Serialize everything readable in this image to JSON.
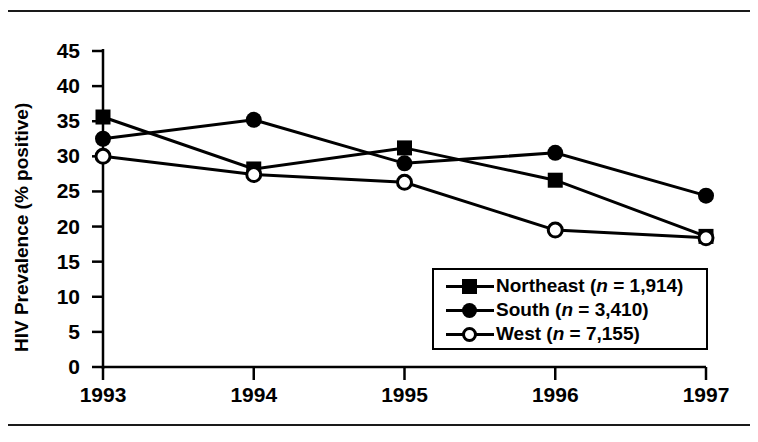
{
  "figure": {
    "rule_top": "horizontal-rule",
    "rule_bottom": "horizontal-rule"
  },
  "chart_data": {
    "type": "line",
    "title": "",
    "xlabel": "",
    "ylabel": "HIV Prevalence (% positive)",
    "x": [
      "1993",
      "1994",
      "1995",
      "1996",
      "1997"
    ],
    "categories": [
      "1993",
      "1994",
      "1995",
      "1996",
      "1997"
    ],
    "xticklabels": [
      "1993",
      "1994",
      "1995",
      "1996",
      "1997"
    ],
    "yticklabels": [
      "0",
      "5",
      "10",
      "15",
      "20",
      "25",
      "30",
      "35",
      "40",
      "45"
    ],
    "yticks": [
      0,
      5,
      10,
      15,
      20,
      25,
      30,
      35,
      40,
      45
    ],
    "ylim": [
      0,
      45
    ],
    "grid": false,
    "legend_position": "lower-right",
    "series": [
      {
        "name": "Northeast",
        "legend_label": "Northeast (n = 1,914)",
        "n": "1,914",
        "marker": "filled-square",
        "color": "#000000",
        "values": [
          35.6,
          28.2,
          31.2,
          26.6,
          18.6
        ]
      },
      {
        "name": "South",
        "legend_label": "South (n = 3,410)",
        "n": "3,410",
        "marker": "filled-circle",
        "color": "#000000",
        "values": [
          32.5,
          35.2,
          29.0,
          30.5,
          24.4
        ]
      },
      {
        "name": "West",
        "legend_label": "West (n = 7,155)",
        "n": "7,155",
        "marker": "open-circle",
        "color": "#000000",
        "values": [
          30.0,
          27.4,
          26.3,
          19.5,
          18.4
        ]
      }
    ]
  },
  "legend": {
    "rows": [
      {
        "label_plain": "Northeast (n = 1,914)",
        "name": "Northeast",
        "n": "1,914"
      },
      {
        "label_plain": "South (n = 3,410)",
        "name": "South",
        "n": "3,410"
      },
      {
        "label_plain": "West (n = 7,155)",
        "name": "West",
        "n": "7,155"
      }
    ]
  }
}
